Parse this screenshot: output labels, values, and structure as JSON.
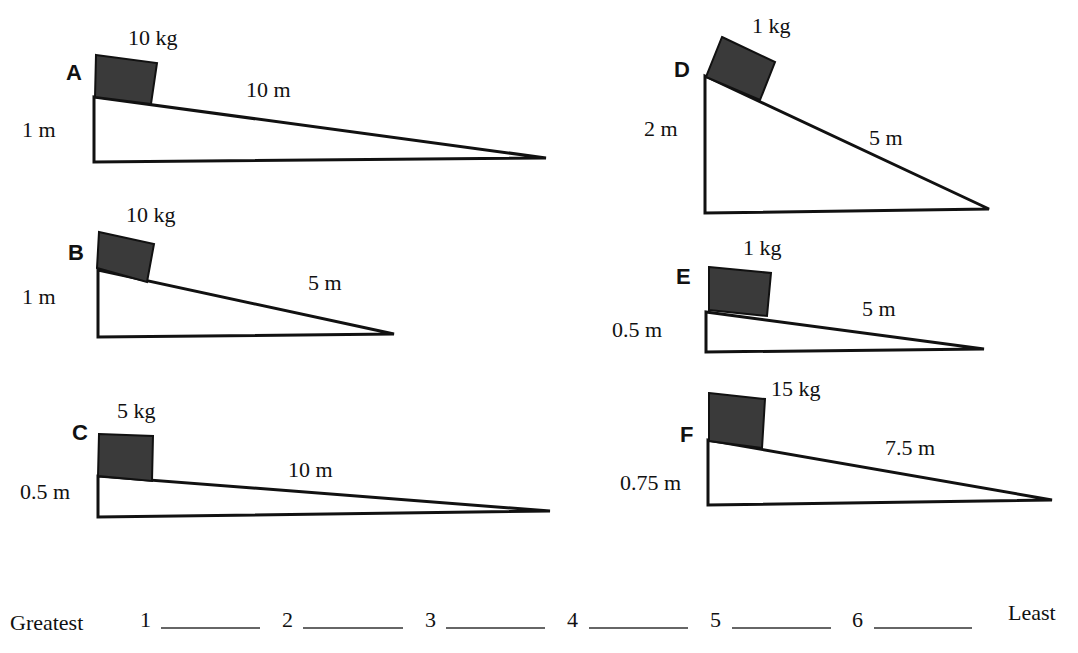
{
  "ramps": [
    {
      "id": "A",
      "mass": "10 kg",
      "length": "10 m",
      "height": "1 m"
    },
    {
      "id": "B",
      "mass": "10 kg",
      "length": "5 m",
      "height": "1 m"
    },
    {
      "id": "C",
      "mass": "5 kg",
      "length": "10 m",
      "height": "0.5 m"
    },
    {
      "id": "D",
      "mass": "1 kg",
      "length": "5 m",
      "height": "2 m"
    },
    {
      "id": "E",
      "mass": "1 kg",
      "length": "5 m",
      "height": "0.5 m"
    },
    {
      "id": "F",
      "mass": "15 kg",
      "length": "7.5 m",
      "height": "0.75 m"
    }
  ],
  "ranking": {
    "greatest_label": "Greatest",
    "least_label": "Least",
    "slots": [
      "1",
      "2",
      "3",
      "4",
      "5",
      "6"
    ]
  }
}
